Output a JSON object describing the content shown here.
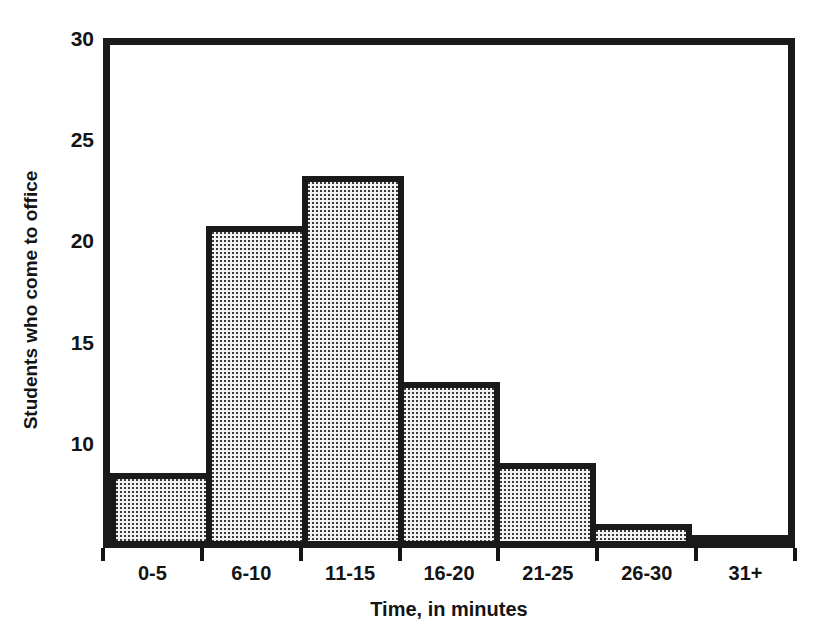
{
  "chart_data": {
    "type": "bar",
    "title": "",
    "subtitle": "",
    "xlabel": "Time, in minutes",
    "ylabel": "Students who come to office",
    "categories": [
      "0-5",
      "6-10",
      "11-15",
      "16-20",
      "21-25",
      "26-30",
      "31+"
    ],
    "values": [
      8.5,
      20.7,
      23.2,
      13,
      9,
      6,
      5.3
    ],
    "yticks": [
      30,
      25,
      20,
      15,
      10
    ],
    "ylim": [
      4.8,
      30
    ],
    "xlim_categories": 7,
    "grid": false,
    "legend": null,
    "bar_fill": "stipple-dot-pattern",
    "bar_fill_color": "#f2f2f2",
    "bar_edge_color": "#1a1a1a",
    "frame_color": "#1a1a1a",
    "text_color": "#141414",
    "note": "Y axis is truncated; the baseline of the plot frame sits near a value of 5 rather than 0."
  }
}
